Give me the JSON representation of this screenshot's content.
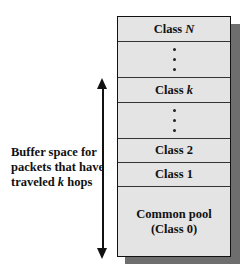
{
  "diagram": {
    "rows": [
      {
        "label": "Class ",
        "italic": "N"
      },
      {
        "type": "ellipsis"
      },
      {
        "label": "Class ",
        "italic": "k"
      },
      {
        "type": "ellipsis"
      },
      {
        "label": "Class 2"
      },
      {
        "label": "Class 1"
      },
      {
        "label_line1": "Common pool",
        "label_line2": "(Class 0)"
      }
    ],
    "side_label": {
      "line1": "Buffer space for",
      "line2": "packets that have",
      "line3_prefix": "traveled ",
      "line3_italic": "k",
      "line3_suffix": " hops"
    },
    "colors": {
      "cell_fill": "#e4e4e4",
      "shadow": "#6e6e6e",
      "border": "#111111"
    }
  }
}
